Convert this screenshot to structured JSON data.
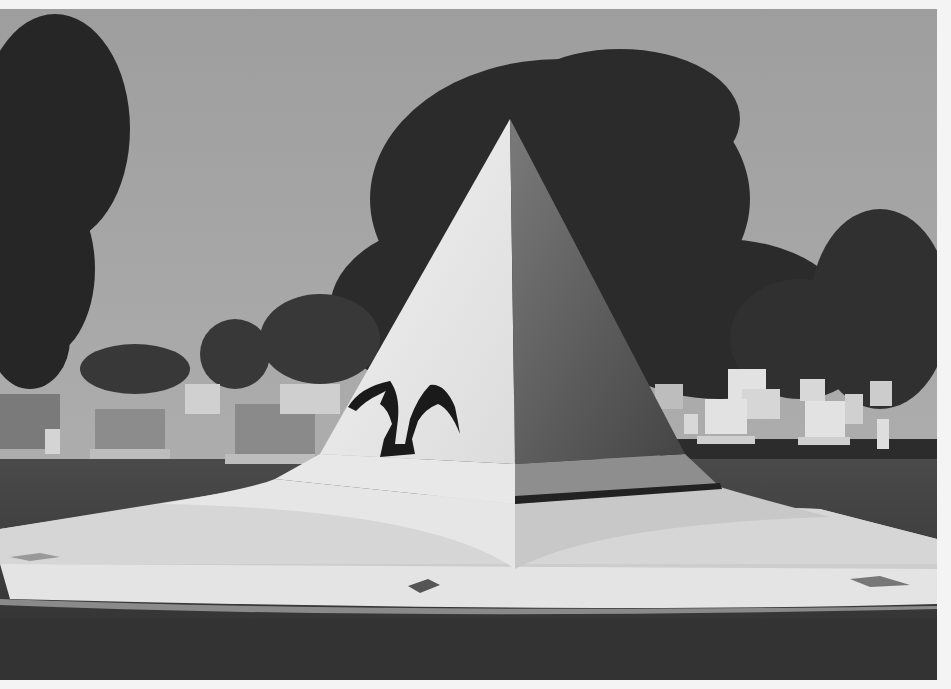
{
  "image": {
    "subject": "Pyramid monument with bronze eagle in cemetery",
    "style": "black-and-white photograph",
    "colors": {
      "sky": "#a8a8a8",
      "trees": "#2a2a2a",
      "pyramid_light": "#ececec",
      "pyramid_shadow": "#555555",
      "base": "#d8d8d8",
      "grass": "#3a3a3a",
      "border": "#f4f4f4"
    }
  }
}
